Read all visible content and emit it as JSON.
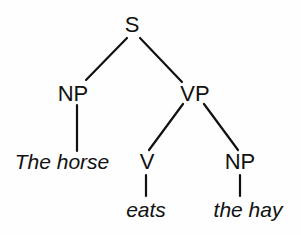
{
  "diagram": {
    "type": "syntax-tree",
    "colors": {
      "ink": "#111111",
      "background": "#ffffff"
    },
    "nodes": {
      "s": {
        "label": "S"
      },
      "np_subject": {
        "label": "NP"
      },
      "vp": {
        "label": "VP"
      },
      "v": {
        "label": "V"
      },
      "np_object": {
        "label": "NP"
      }
    },
    "leaves": {
      "subject": {
        "label": "The horse"
      },
      "verb": {
        "label": "eats"
      },
      "object": {
        "label": "the hay"
      }
    },
    "edges": [
      {
        "from": "S",
        "to": "NP"
      },
      {
        "from": "S",
        "to": "VP"
      },
      {
        "from": "NP",
        "to": "The horse"
      },
      {
        "from": "VP",
        "to": "V"
      },
      {
        "from": "VP",
        "to": "NP"
      },
      {
        "from": "V",
        "to": "eats"
      },
      {
        "from": "NP",
        "to": "the hay"
      }
    ]
  }
}
